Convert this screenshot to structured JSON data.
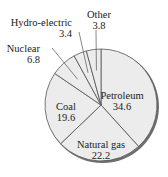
{
  "chart_data": {
    "type": "pie",
    "title": "",
    "categories": [
      "Petroleum",
      "Natural gas",
      "Coal",
      "Nuclear",
      "Hydro-electric",
      "Other"
    ],
    "values": [
      34.6,
      22.2,
      19.6,
      6.8,
      3.4,
      3.8
    ],
    "start_angle": "12 o'clock",
    "direction": "clockwise",
    "legend": "none (direct labels)",
    "colors": {
      "fill": "#ececec",
      "stroke": "#555555",
      "shadow": "#6e6e6e"
    }
  },
  "labels": {
    "petroleum": {
      "name": "Petroleum",
      "value": "34.6"
    },
    "natural_gas": {
      "name": "Natural gas",
      "value": "22.2"
    },
    "coal": {
      "name": "Coal",
      "value": "19.6"
    },
    "nuclear": {
      "name": "Nuclear",
      "value": "6.8"
    },
    "hydro": {
      "name": "Hydro-electric",
      "value": "3.4"
    },
    "other": {
      "name": "Other",
      "value": "3.8"
    }
  }
}
